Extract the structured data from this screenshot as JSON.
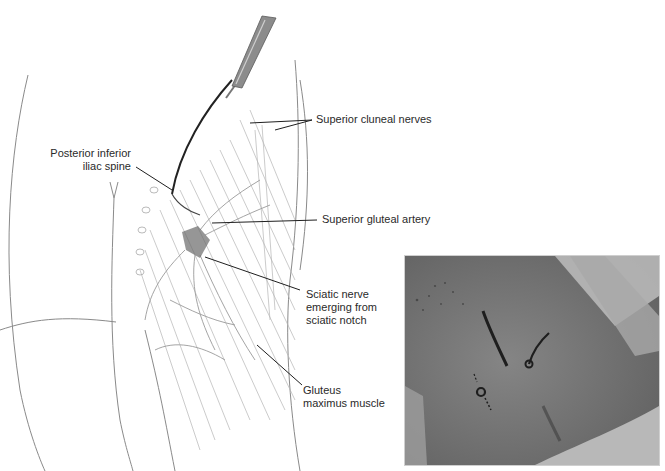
{
  "figure": {
    "illustration": {
      "subject": "posterior hip / gluteal region with scalpel incision",
      "labels": {
        "pii_spine_line1": "Posterior  inferior",
        "pii_spine_line2": "iliac spine",
        "superior_cluneal": "Superior cluneal nerves",
        "superior_gluteal": "Superior gluteal artery",
        "sciatic_line1": "Sciatic nerve",
        "sciatic_line2": "emerging from",
        "sciatic_line3": "sciatic notch",
        "gluteus_line1": "Gluteus",
        "gluteus_line2": "maximus muscle"
      }
    },
    "photo": {
      "subject": "intraoperative photograph of skin markings over buttock",
      "colors": {
        "skin": "#7a7a7a",
        "drape": "#c8c8c8",
        "marking": "#1e1e1e"
      }
    }
  }
}
